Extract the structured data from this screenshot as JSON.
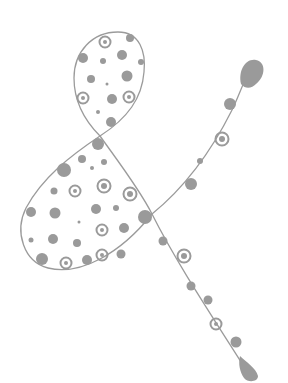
{
  "illustration": {
    "subject": "polka-dot ampersand",
    "colors": {
      "background": "#ffffff",
      "stroke": "#9b9b9b",
      "dot": "#9a9a9a"
    },
    "upper_loop_dots": [
      {
        "x": 105,
        "y": 42,
        "r": 4,
        "ring": true
      },
      {
        "x": 130,
        "y": 38,
        "r": 4
      },
      {
        "x": 83,
        "y": 58,
        "r": 5
      },
      {
        "x": 103,
        "y": 61,
        "r": 3
      },
      {
        "x": 122,
        "y": 55,
        "r": 5
      },
      {
        "x": 141,
        "y": 62,
        "r": 3
      },
      {
        "x": 91,
        "y": 79,
        "r": 4
      },
      {
        "x": 127,
        "y": 76,
        "r": 5.5
      },
      {
        "x": 107,
        "y": 84,
        "r": 1.5
      },
      {
        "x": 83,
        "y": 98,
        "r": 4,
        "ring": true
      },
      {
        "x": 112,
        "y": 99,
        "r": 5
      },
      {
        "x": 129,
        "y": 97,
        "r": 4,
        "ring": true
      },
      {
        "x": 98,
        "y": 112,
        "r": 2
      },
      {
        "x": 111,
        "y": 122,
        "r": 5
      }
    ],
    "lower_loop_dots": [
      {
        "x": 98,
        "y": 144,
        "r": 6
      },
      {
        "x": 82,
        "y": 159,
        "r": 4
      },
      {
        "x": 104,
        "y": 162,
        "r": 3
      },
      {
        "x": 64,
        "y": 170,
        "r": 7
      },
      {
        "x": 92,
        "y": 168,
        "r": 2
      },
      {
        "x": 54,
        "y": 191,
        "r": 3.5
      },
      {
        "x": 75,
        "y": 191,
        "r": 4,
        "ring": true
      },
      {
        "x": 104,
        "y": 186,
        "r": 5,
        "ring": true
      },
      {
        "x": 130,
        "y": 194,
        "r": 5,
        "ring": true
      },
      {
        "x": 31,
        "y": 212,
        "r": 5
      },
      {
        "x": 55,
        "y": 213,
        "r": 5.5
      },
      {
        "x": 96,
        "y": 209,
        "r": 5
      },
      {
        "x": 116,
        "y": 208,
        "r": 3
      },
      {
        "x": 79,
        "y": 222,
        "r": 1.5
      },
      {
        "x": 102,
        "y": 230,
        "r": 4,
        "ring": true
      },
      {
        "x": 124,
        "y": 228,
        "r": 5
      },
      {
        "x": 145,
        "y": 217,
        "r": 7
      },
      {
        "x": 31,
        "y": 240,
        "r": 2.5
      },
      {
        "x": 53,
        "y": 239,
        "r": 5
      },
      {
        "x": 77,
        "y": 243,
        "r": 4
      },
      {
        "x": 102,
        "y": 255,
        "r": 4,
        "ring": true
      },
      {
        "x": 121,
        "y": 254,
        "r": 4.5
      },
      {
        "x": 42,
        "y": 259,
        "r": 6
      },
      {
        "x": 66,
        "y": 263,
        "r": 4,
        "ring": true
      },
      {
        "x": 87,
        "y": 260,
        "r": 5
      }
    ],
    "stem_dots": [
      {
        "x": 163,
        "y": 241,
        "r": 4.5
      },
      {
        "x": 184,
        "y": 256,
        "r": 5,
        "ring": true
      },
      {
        "x": 191,
        "y": 286,
        "r": 4.5
      },
      {
        "x": 208,
        "y": 300,
        "r": 4.5
      },
      {
        "x": 216,
        "y": 324,
        "r": 4,
        "ring": true
      },
      {
        "x": 236,
        "y": 342,
        "r": 5.5
      }
    ],
    "tail_dots": [
      {
        "x": 230,
        "y": 104,
        "r": 6
      },
      {
        "x": 222,
        "y": 139,
        "r": 5,
        "ring": true
      },
      {
        "x": 200,
        "y": 161,
        "r": 3
      },
      {
        "x": 191,
        "y": 184,
        "r": 6
      }
    ]
  }
}
